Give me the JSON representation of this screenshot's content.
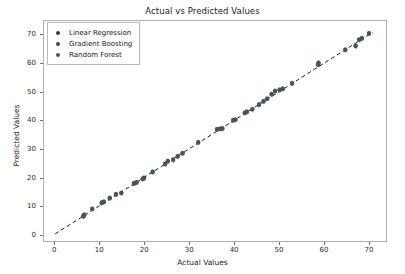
{
  "chart_data": {
    "type": "scatter",
    "title": "Actual vs Predicted Values",
    "xlabel": "Actual Values",
    "ylabel": "Predicted Values",
    "xlim": [
      -2.5,
      74.0
    ],
    "ylim": [
      -2.5,
      75.0
    ],
    "xticks": [
      0,
      10,
      20,
      30,
      40,
      50,
      60,
      70
    ],
    "yticks": [
      0,
      10,
      20,
      30,
      40,
      50,
      60,
      70
    ],
    "grid": false,
    "legend_position": "upper left",
    "marker": "circle",
    "marker_size": 4.2,
    "marker_alpha": 0.75,
    "reference_line": {
      "label": "identity",
      "style": "dashed",
      "color": "#1a1a1a",
      "x": [
        0,
        71
      ],
      "y": [
        0,
        71
      ]
    },
    "series": [
      {
        "name": "Linear Regression",
        "color": "#2f3c46",
        "x": [
          6.3,
          6.5,
          8.3,
          10.4,
          10.9,
          12.2,
          13.6,
          14.8,
          17.6,
          18.2,
          19.6,
          19.9,
          21.8,
          24.6,
          25.2,
          26.4,
          27.4,
          28.5,
          32.0,
          36.2,
          36.9,
          37.4,
          39.8,
          40.3,
          42.4,
          42.9,
          44.1,
          45.6,
          46.6,
          47.4,
          48.4,
          49.2,
          50.2,
          50.9,
          53.0,
          58.8,
          58.9,
          64.9,
          67.2,
          68.0,
          68.6,
          70.2
        ],
        "y": [
          6.2,
          6.6,
          8.8,
          10.9,
          11.3,
          12.6,
          13.9,
          14.4,
          17.7,
          18.1,
          19.4,
          19.7,
          21.8,
          24.6,
          25.6,
          26.1,
          27.3,
          28.4,
          32.2,
          36.8,
          37.0,
          37.1,
          40.0,
          40.2,
          42.6,
          43.0,
          43.9,
          45.5,
          46.7,
          47.6,
          49.2,
          50.3,
          50.7,
          51.1,
          53.0,
          59.6,
          60.2,
          64.8,
          66.2,
          68.4,
          68.9,
          70.6
        ]
      },
      {
        "name": "Gradient Boosting",
        "color": "#3a4a55",
        "x": [
          6.3,
          6.5,
          8.3,
          10.4,
          10.9,
          12.2,
          13.6,
          14.8,
          17.6,
          18.2,
          19.6,
          19.9,
          21.8,
          24.6,
          25.2,
          26.4,
          27.4,
          28.5,
          32.0,
          36.2,
          36.9,
          37.4,
          39.8,
          40.3,
          42.4,
          42.9,
          44.1,
          45.6,
          46.6,
          47.4,
          48.4,
          49.2,
          50.2,
          50.9,
          53.0,
          58.8,
          58.9,
          64.9,
          67.2,
          68.0,
          68.6,
          70.2
        ],
        "y": [
          6.5,
          6.9,
          8.9,
          11.2,
          11.5,
          12.8,
          14.1,
          14.6,
          18.0,
          18.3,
          19.6,
          19.9,
          22.0,
          24.9,
          25.8,
          26.4,
          27.5,
          28.6,
          32.4,
          37.0,
          37.2,
          37.3,
          40.2,
          40.4,
          42.8,
          43.2,
          44.1,
          45.8,
          46.9,
          47.8,
          49.4,
          50.5,
          50.9,
          51.3,
          53.2,
          59.8,
          60.4,
          65.0,
          66.4,
          68.6,
          69.1,
          70.8
        ]
      },
      {
        "name": "Random Forest",
        "color": "#45555f",
        "x": [
          6.3,
          6.5,
          8.3,
          10.4,
          10.9,
          12.2,
          13.6,
          14.8,
          17.6,
          18.2,
          19.6,
          19.9,
          21.8,
          24.6,
          25.2,
          26.4,
          27.4,
          28.5,
          32.0,
          36.2,
          36.9,
          37.4,
          39.8,
          40.3,
          42.4,
          42.9,
          44.1,
          45.6,
          46.6,
          47.4,
          48.4,
          49.2,
          50.2,
          50.9,
          53.0,
          58.8,
          58.9,
          64.9,
          67.2,
          68.0,
          68.6,
          70.2
        ],
        "y": [
          6.0,
          6.3,
          8.6,
          10.7,
          11.1,
          12.4,
          13.7,
          14.2,
          17.5,
          17.9,
          19.2,
          19.5,
          21.6,
          24.4,
          25.4,
          25.9,
          27.1,
          28.2,
          32.0,
          36.6,
          36.8,
          36.9,
          39.8,
          40.0,
          42.4,
          42.8,
          43.7,
          45.3,
          46.5,
          47.4,
          49.0,
          50.1,
          50.5,
          50.9,
          52.8,
          59.4,
          60.0,
          64.6,
          66.0,
          68.2,
          68.7,
          70.4
        ]
      }
    ]
  },
  "legend": {
    "items": [
      {
        "label": "Linear Regression",
        "color": "#2f3c46"
      },
      {
        "label": "Gradient Boosting",
        "color": "#3a4a55"
      },
      {
        "label": "Random Forest",
        "color": "#45555f"
      }
    ]
  }
}
